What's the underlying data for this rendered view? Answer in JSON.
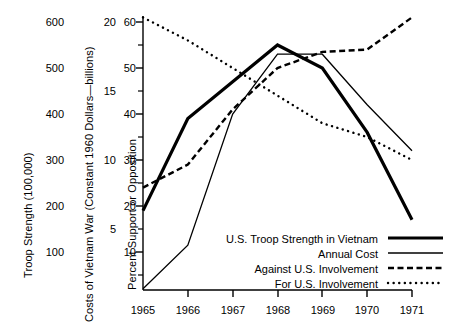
{
  "figure": {
    "background": "#ffffff",
    "ink": "#000000",
    "width": 453,
    "height": 332
  },
  "axes": {
    "left_axis": {
      "title": "Troop Strength (100,000)",
      "ticks": [
        "600",
        "500",
        "400",
        "300",
        "200",
        "100"
      ],
      "tick_values": [
        600,
        500,
        400,
        300,
        200,
        100
      ]
    },
    "middle_axis": {
      "title": "Costs of Vietnam War (Constant 1960 Dollars—billions)",
      "ticks": [
        "20",
        "15",
        "10",
        "5"
      ],
      "tick_values": [
        20,
        15,
        10,
        5
      ]
    },
    "right_of_labels_axis": {
      "title": "Percent Support or Opposition",
      "ticks": [
        "60",
        "50",
        "40",
        "30",
        "20",
        "10"
      ],
      "tick_values": [
        60,
        50,
        40,
        30,
        20,
        10
      ],
      "minor_ticks": [
        55,
        45,
        35,
        25,
        15,
        5
      ]
    },
    "x_axis": {
      "ticks": [
        "1965",
        "1966",
        "1967",
        "1968",
        "1969",
        "1970",
        "1971"
      ]
    }
  },
  "legend": {
    "position": "bottom-right-inside",
    "entries": [
      {
        "label": "U.S. Troop Strength in Vietnam",
        "style": "thick-solid"
      },
      {
        "label": "Annual Cost",
        "style": "thin-solid"
      },
      {
        "label": "Against U.S. Involvement",
        "style": "dashed"
      },
      {
        "label": "For U.S. Involvement",
        "style": "dotted"
      }
    ]
  },
  "chart_data": {
    "type": "line",
    "title": "",
    "xlabel": "",
    "ylabel": "Percent Support or Opposition",
    "grid": false,
    "x": [
      1965,
      1966,
      1967,
      1968,
      1969,
      1970,
      1971
    ],
    "categories": [
      "1965",
      "1966",
      "1967",
      "1968",
      "1969",
      "1970",
      "1971"
    ],
    "ylim": [
      1.7,
      62
    ],
    "xlim": [
      1965,
      1971
    ],
    "axis_note": "All four series are plotted against a common vertical grid; the same pixel height is read as Troop Strength (100,000), Annual Cost (billions of constant 1960 dollars) and Percent Support or Opposition on the three stacked left-hand scales.",
    "series": [
      {
        "name": "U.S. Troop Strength in Vietnam",
        "style": "thick-solid",
        "scale": "Troop Strength (100,000)",
        "values_percent_scale": [
          19,
          39,
          47,
          55,
          50,
          36,
          17
        ],
        "values_troop_strength": [
          190,
          390,
          470,
          550,
          500,
          360,
          170
        ]
      },
      {
        "name": "Annual Cost",
        "style": "thin-solid",
        "scale": "Costs of Vietnam War (Constant 1960 Dollars—billions)",
        "values_percent_scale": [
          2,
          11.5,
          40,
          53,
          53,
          42,
          32
        ],
        "values_cost_billions": [
          1.1,
          4.2,
          13.4,
          17.7,
          17.7,
          14.0,
          10.7
        ]
      },
      {
        "name": "Against U.S. Involvement",
        "style": "dashed",
        "scale": "Percent Support or Opposition",
        "values_percent_scale": [
          24,
          29,
          41,
          50,
          53.5,
          54,
          61
        ]
      },
      {
        "name": "For U.S. Involvement",
        "style": "dotted",
        "scale": "Percent Support or Opposition",
        "values_percent_scale": [
          61,
          56,
          50,
          44,
          38,
          35,
          30
        ]
      }
    ]
  }
}
